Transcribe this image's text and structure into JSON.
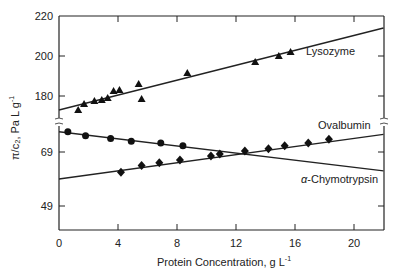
{
  "chart_data": {
    "type": "scatter",
    "title": "",
    "xlabel": "Protein Concentration, g L⁻¹",
    "xlabel_main": "Protein Concentration, g L",
    "xlabel_sup": "-1",
    "ylabel_main": "π/c₂, Pa L g",
    "ylabel_sup": "-1",
    "xlim": [
      0,
      22
    ],
    "x_ticks": [
      0,
      4,
      8,
      12,
      16,
      20
    ],
    "y_axis_broken": true,
    "y_upper": {
      "ticks": [
        180,
        200,
        220
      ],
      "range": [
        171,
        220
      ]
    },
    "y_lower": {
      "ticks": [
        49,
        69
      ],
      "range": [
        40,
        77
      ]
    },
    "grid": false,
    "legend": "inline labels",
    "series": [
      {
        "name": "Lysozyme",
        "marker": "triangle",
        "panel": "upper",
        "points": [
          [
            1.3,
            173
          ],
          [
            1.7,
            176
          ],
          [
            2.4,
            177.5
          ],
          [
            2.9,
            178
          ],
          [
            3.3,
            179
          ],
          [
            3.7,
            182.5
          ],
          [
            4.1,
            183
          ],
          [
            5.4,
            186
          ],
          [
            5.6,
            178.5
          ],
          [
            8.7,
            191.5
          ],
          [
            13.3,
            197
          ],
          [
            14.9,
            200
          ],
          [
            15.7,
            202
          ]
        ],
        "fit_line": [
          [
            0,
            173
          ],
          [
            22,
            214
          ]
        ]
      },
      {
        "name": "Ovalbumin",
        "marker": "diamond",
        "panel": "lower",
        "points": [
          [
            4.2,
            61.5
          ],
          [
            5.6,
            64
          ],
          [
            6.8,
            65
          ],
          [
            8.2,
            66
          ],
          [
            10.3,
            67.5
          ],
          [
            10.9,
            68.3
          ],
          [
            12.6,
            69.4
          ],
          [
            14.2,
            70.2
          ],
          [
            15.3,
            71.3
          ],
          [
            16.9,
            72.3
          ],
          [
            18.3,
            73.7
          ]
        ],
        "fit_line": [
          [
            0,
            59
          ],
          [
            22,
            75.5
          ]
        ]
      },
      {
        "name": "α-Chymotrypsin",
        "marker": "circle",
        "panel": "lower",
        "points": [
          [
            0.6,
            76.5
          ],
          [
            1.8,
            75
          ],
          [
            3.5,
            74
          ],
          [
            4.9,
            73
          ],
          [
            6.9,
            72.3
          ],
          [
            8.4,
            71.3
          ]
        ],
        "fit_line": [
          [
            0,
            76.5
          ],
          [
            22,
            62
          ]
        ]
      }
    ],
    "labels": {
      "lysozyme": "Lysozyme",
      "ovalbumin": "Ovalbumin",
      "chymotrypsin_prefix": "α",
      "chymotrypsin_rest": "-Chymotrypsin"
    }
  }
}
